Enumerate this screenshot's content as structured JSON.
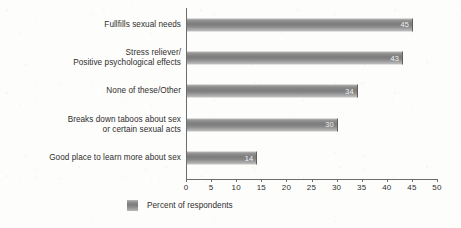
{
  "chart_data": {
    "type": "bar",
    "orientation": "horizontal",
    "title": "",
    "subtitle": "",
    "xlabel": "",
    "ylabel": "",
    "xlim": [
      0,
      50
    ],
    "xticks": [
      0,
      5,
      10,
      15,
      20,
      25,
      30,
      35,
      40,
      45,
      50
    ],
    "xtick_labels": [
      "0",
      "5",
      "10",
      "15",
      "20",
      "25",
      "30",
      "35",
      "40",
      "45",
      "50"
    ],
    "grid": false,
    "legend_position": "bottom-left",
    "legend": [
      "Percent of respondents"
    ],
    "categories": [
      "Fullfills sexual needs",
      "Stress reliever/\nPositive psychological effects",
      "None of these/Other",
      "Breaks down taboos about sex\nor certain sexual acts",
      "Good place to learn more about sex"
    ],
    "values": [
      45,
      43,
      34,
      30,
      14
    ],
    "value_labels": [
      "45",
      "43",
      "34",
      "30",
      "14"
    ],
    "series": [
      {
        "name": "Percent of respondents",
        "values": [
          45,
          43,
          34,
          30,
          14
        ]
      }
    ],
    "colors": {
      "bar_light": "#b9b9b9",
      "bar_mid": "#7c7c7c",
      "bar_edge": "#5f5f5f",
      "axis": "#6d6d6d",
      "text": "#2e2e2e",
      "value_text": "#f2f2f2",
      "background": "#fdfdfb"
    }
  },
  "legend": {
    "swatch_name": "legend-swatch-percent-of-respondents",
    "label": "Percent of respondents"
  }
}
